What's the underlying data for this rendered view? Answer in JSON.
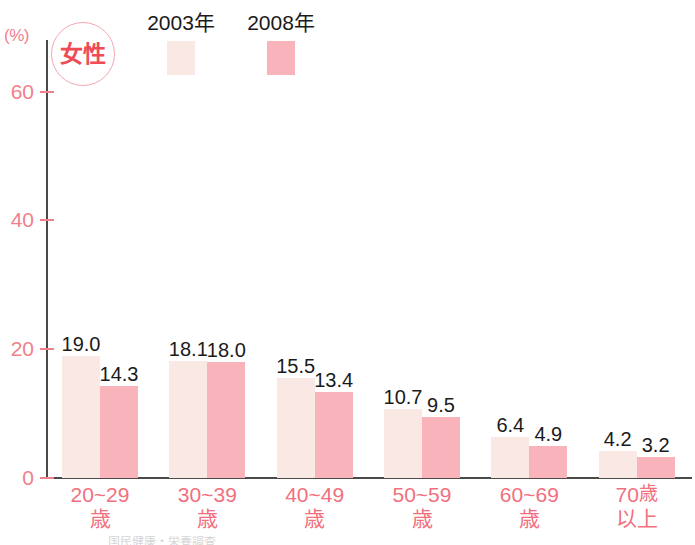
{
  "chart_data": {
    "type": "bar",
    "title": "",
    "subtitle": "",
    "xlabel": "",
    "ylabel": "(%)",
    "unit_label": "(%)",
    "gender_badge": "女性",
    "ylim": [
      0,
      68
    ],
    "yticks": [
      0,
      20,
      40,
      60
    ],
    "ytick_labels": [
      "0",
      "20",
      "40",
      "60"
    ],
    "grid": false,
    "legend_position": "top",
    "categories": [
      "20~29歳",
      "30~39歳",
      "40~49歳",
      "50~59歳",
      "60~69歳",
      "70歳以上"
    ],
    "category_lines": [
      {
        "line1": "20~29",
        "line2": "歳"
      },
      {
        "line1": "30~39",
        "line2": "歳"
      },
      {
        "line1": "40~49",
        "line2": "歳"
      },
      {
        "line1": "50~59",
        "line2": "歳"
      },
      {
        "line1": "60~69",
        "line2": "歳"
      },
      {
        "line1": "70",
        "suffix": "歳",
        "line2": "以上"
      }
    ],
    "series": [
      {
        "name": "2003年",
        "color": "#fae8e4",
        "values": [
          19.0,
          18.1,
          15.5,
          10.7,
          6.4,
          4.2
        ],
        "labels": [
          "19.0",
          "18.1",
          "15.5",
          "10.7",
          "6.4",
          "4.2"
        ]
      },
      {
        "name": "2008年",
        "color": "#f8b3bb",
        "values": [
          14.3,
          18.0,
          13.4,
          9.5,
          4.9,
          3.2
        ],
        "labels": [
          "14.3",
          "18.0",
          "13.4",
          "9.5",
          "4.9",
          "3.2"
        ]
      }
    ]
  },
  "colors": {
    "axis": "#4a4a48",
    "tick_text": "#f2808c",
    "category_text": "#f2707e",
    "badge_text": "#ef4a55",
    "badge_ring": "#f3a7b0",
    "value_text": "#1a1a1a",
    "legend_text": "#1a1a1a",
    "series_2003": "#fae8e4",
    "series_2008": "#f8b3bb",
    "background": "#ffffff"
  },
  "footnote": "国民健康・栄養調査"
}
